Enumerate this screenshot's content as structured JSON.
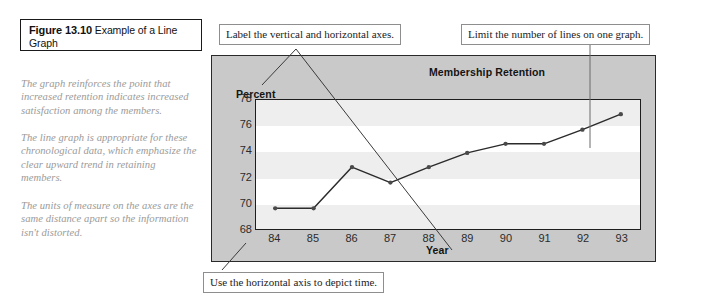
{
  "figure": {
    "number_label": "Figure 13.10",
    "title": "Example of a Line Graph"
  },
  "notes": [
    "The graph reinforces the point that increased retention indicates increased satisfaction among the members.",
    "The line graph is appropriate for these chronological data, which emphasize the clear upward trend in retaining members.",
    "The units of measure on the axes are the same distance apart so the information isn't distorted."
  ],
  "callouts": [
    {
      "id": "axes",
      "text": "Label the vertical and horizontal axes."
    },
    {
      "id": "lines",
      "text": "Limit the number of lines on one graph."
    },
    {
      "id": "time",
      "text": "Use the horizontal axis to depict time."
    }
  ],
  "colors": {
    "panel_background": "#c9c9c9",
    "plot_background": "#ffffff",
    "band": "#eeeeee",
    "line": "#2b2b2b",
    "marker": "#4a4a4a",
    "axis": "#1d1d1d",
    "note_text": "#9a9a9a",
    "callout_border": "#8e8e8e"
  },
  "chart_data": {
    "type": "line",
    "title": "Membership Retention",
    "xlabel": "Year",
    "ylabel": "Percent",
    "categories": [
      "84",
      "85",
      "86",
      "87",
      "88",
      "89",
      "90",
      "91",
      "92",
      "93"
    ],
    "values": [
      69.6,
      69.6,
      72.8,
      71.6,
      72.8,
      73.9,
      74.6,
      74.6,
      75.7,
      76.9
    ],
    "series": [
      {
        "name": "Membership Retention",
        "values": [
          69.6,
          69.6,
          72.8,
          71.6,
          72.8,
          73.9,
          74.6,
          74.6,
          75.7,
          76.9
        ]
      }
    ],
    "yticks": [
      "78",
      "76",
      "74",
      "72",
      "70",
      "68"
    ],
    "ylim": [
      68,
      78
    ],
    "xlim": [
      "84",
      "93"
    ],
    "grid": false,
    "banded_background": true,
    "legend": "none",
    "markers": true
  }
}
